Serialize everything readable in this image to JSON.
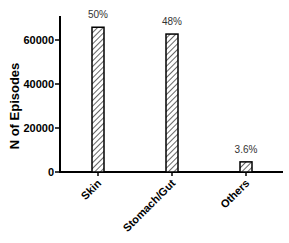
{
  "chart_data": {
    "type": "bar",
    "title_visible": false,
    "xlabel": "",
    "ylabel": "N of Episodes",
    "categories": [
      "Skin",
      "Stomach/Gut",
      "Others"
    ],
    "values": [
      65800,
      62700,
      4600
    ],
    "data_labels": [
      "50%",
      "48%",
      "3.6%"
    ],
    "yticks": [
      0,
      20000,
      40000,
      60000
    ],
    "ytick_labels": [
      "0",
      "20000",
      "40000",
      "60000"
    ],
    "ylim": [
      0,
      69000
    ],
    "grid": false,
    "legend": null,
    "bar_fill": "diagonal-hatch",
    "bar_color": "#000000"
  }
}
